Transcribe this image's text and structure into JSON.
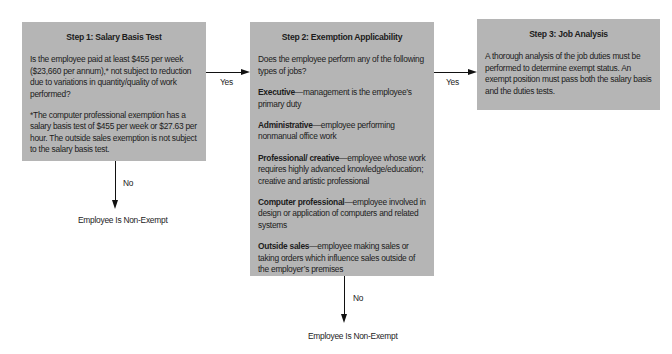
{
  "diagram": {
    "type": "flowchart",
    "steps": [
      {
        "id": "step1",
        "title": "Step 1: Salary Basis Test",
        "paragraphs": [
          "Is the employee paid at least $455 per week ($23,660 per annum),* not subject to reduction due to variations in quantity/quality of work performed?",
          "*The computer professional exemption has a salary basis test of $455 per week or $27.63 per hour. The outside sales exemption is not subject to the salary basis test."
        ]
      },
      {
        "id": "step2",
        "title": "Step 2: Exemption Applicability",
        "intro": "Does the employee perform any of the following types of jobs?",
        "job_types": [
          {
            "term": "Executive",
            "description": "—management is the employee’s primary duty"
          },
          {
            "term": "Administrative",
            "description": "—employee performing nonmanual office work"
          },
          {
            "term": "Professional/ creative",
            "description": "—employee whose work requires highly advanced knowledge/education; creative and artistic professional"
          },
          {
            "term": "Computer professional",
            "description": "—employee involved in design or application of computers and related systems"
          },
          {
            "term": "Outside sales",
            "description": "—employee making sales or taking orders which influence sales outside of the employer’s premises"
          }
        ]
      },
      {
        "id": "step3",
        "title": "Step 3: Job Analysis",
        "paragraphs": [
          "A thorough analysis of the job duties must be performed to determine exempt status. An exempt position must pass both the salary basis and the duties tests."
        ]
      }
    ],
    "edges": [
      {
        "from": "step1",
        "to": "step2",
        "label": "Yes"
      },
      {
        "from": "step2",
        "to": "step3",
        "label": "Yes"
      },
      {
        "from": "step1",
        "to": "outcome1",
        "label": "No"
      },
      {
        "from": "step2",
        "to": "outcome2",
        "label": "No"
      }
    ],
    "outcomes": {
      "outcome1": "Employee Is Non-Exempt",
      "outcome2": "Employee Is Non-Exempt"
    }
  },
  "colors": {
    "box_fill": "#b5b5b5",
    "line": "#111111",
    "text": "#1c1c1c",
    "background": "#ffffff"
  }
}
